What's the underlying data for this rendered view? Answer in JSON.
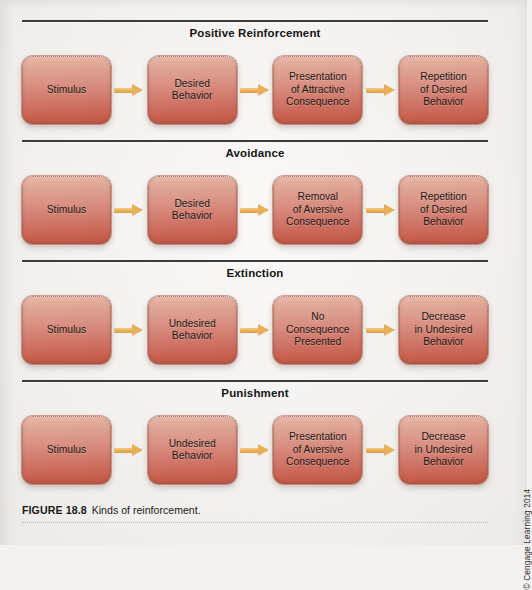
{
  "figure": {
    "label": "FIGURE 18.8",
    "caption": "Kinds of reinforcement.",
    "credit": "© Cengage Learning 2014",
    "accent_box_top": "#e8b9ab",
    "accent_box_bottom": "#c25a4b",
    "accent_arrow": "#e8ae58",
    "rule_color": "#3c3a3a",
    "page_background": "#f4f2f0"
  },
  "sections": [
    {
      "title": "Positive Reinforcement",
      "nodes": [
        {
          "text": "Stimulus"
        },
        {
          "text": "Desired\nBehavior"
        },
        {
          "text": "Presentation\nof Attractive\nConsequence"
        },
        {
          "text": "Repetition\nof Desired\nBehavior"
        }
      ]
    },
    {
      "title": "Avoidance",
      "nodes": [
        {
          "text": "Stimulus"
        },
        {
          "text": "Desired\nBehavior"
        },
        {
          "text": "Removal\nof Aversive\nConsequence"
        },
        {
          "text": "Repetition\nof Desired\nBehavior"
        }
      ]
    },
    {
      "title": "Extinction",
      "nodes": [
        {
          "text": "Stimulus"
        },
        {
          "text": "Undesired\nBehavior"
        },
        {
          "text": "No\nConsequence\nPresented"
        },
        {
          "text": "Decrease\nin Undesired\nBehavior"
        }
      ]
    },
    {
      "title": "Punishment",
      "nodes": [
        {
          "text": "Stimulus"
        },
        {
          "text": "Undesired\nBehavior"
        },
        {
          "text": "Presentation\nof Aversive\nConsequence"
        },
        {
          "text": "Decrease\nin Undesired\nBehavior"
        }
      ]
    }
  ]
}
